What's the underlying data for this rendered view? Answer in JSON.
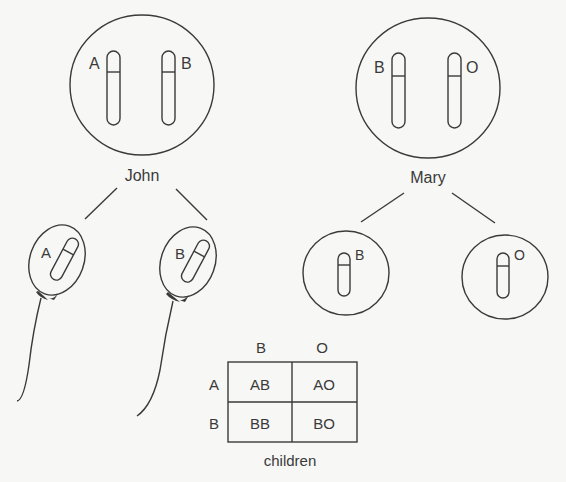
{
  "parents": {
    "father": {
      "name": "John",
      "alleles": [
        "A",
        "B"
      ]
    },
    "mother": {
      "name": "Mary",
      "alleles": [
        "B",
        "O"
      ]
    }
  },
  "gametes": {
    "sperm": [
      {
        "allele": "A"
      },
      {
        "allele": "B"
      }
    ],
    "eggs": [
      {
        "allele": "B"
      },
      {
        "allele": "O"
      }
    ]
  },
  "punnett": {
    "column_headers": [
      "B",
      "O"
    ],
    "row_headers": [
      "A",
      "B"
    ],
    "cells": [
      [
        "AB",
        "AO"
      ],
      [
        "BB",
        "BO"
      ]
    ],
    "caption": "children"
  },
  "colors": {
    "ink": "#3a3a3a",
    "background": "#f7f7f5"
  }
}
